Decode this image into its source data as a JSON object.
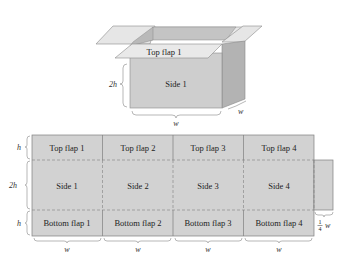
{
  "box3d": {
    "top_flap_label": "Top flap 1",
    "side_label": "Side 1",
    "height_label": "2h",
    "width_label": "w",
    "depth_label": "w"
  },
  "net": {
    "rows": {
      "top": [
        "Top flap 1",
        "Top flap 2",
        "Top flap 3",
        "Top flap 4"
      ],
      "side": [
        "Side 1",
        "Side 2",
        "Side 3",
        "Side 4"
      ],
      "bottom": [
        "Bottom flap 1",
        "Bottom flap 2",
        "Bottom flap 3",
        "Bottom flap 4"
      ]
    },
    "row_dimension_labels": [
      "h",
      "2h",
      "h"
    ],
    "column_dimension_labels": [
      "w",
      "w",
      "w",
      "w"
    ],
    "tab_width_label_num": "1",
    "tab_width_label_den": "4",
    "tab_width_label_var": "w"
  },
  "colors": {
    "face_front": "#cfcfcf",
    "face_side": "#b5b5b5",
    "flap_light": "#e6e6e6",
    "flap_inner": "#bdbdbd",
    "net_fill": "#d2d2d2",
    "stroke": "#7a7a7a"
  }
}
